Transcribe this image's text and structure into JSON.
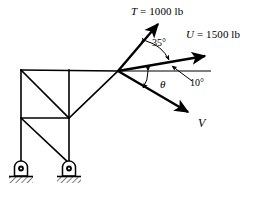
{
  "figure": {
    "type": "free-body / truss force diagram",
    "caption": "",
    "background_color": "#ffffff",
    "line_color": "#000000"
  },
  "forces": [
    {
      "id": "T",
      "symbol": "T",
      "equals": "=",
      "magnitude": "1000",
      "unit": "lb",
      "label": "T = 1000 lb",
      "direction": "up-right",
      "arrow": "single-head"
    },
    {
      "id": "U",
      "symbol": "U",
      "equals": "=",
      "magnitude": "1500",
      "unit": "lb",
      "label": "U = 1500 lb",
      "direction": "right-up",
      "arrow": "single-head"
    },
    {
      "id": "V",
      "symbol": "V",
      "equals": "",
      "magnitude": "",
      "unit": "",
      "label": "V",
      "direction": "down-right",
      "arrow": "single-head"
    }
  ],
  "angles": [
    {
      "id": "angle-35",
      "value": "35",
      "unit": "°",
      "label": "35°",
      "between": "T and U"
    },
    {
      "id": "angle-10",
      "value": "10",
      "unit": "°",
      "label": "10°",
      "between": "U and horizontal reference",
      "has_leader_line": true
    },
    {
      "id": "angle-theta",
      "value": "θ",
      "unit": "",
      "label": "θ",
      "between": "horizontal reference and V",
      "unknown": true
    }
  ],
  "structure": {
    "name": "bracket truss",
    "members": [
      "top chord",
      "left column",
      "center post",
      "mid chord",
      "upper diagonal",
      "lower diagonal",
      "gusset diagonal"
    ],
    "supports": [
      {
        "id": "support-left",
        "type": "pin-support",
        "ground": "hatched"
      },
      {
        "id": "support-right",
        "type": "pin-support",
        "ground": "hatched"
      }
    ],
    "load_joint": {
      "id": "joint-load",
      "description": "force application point"
    }
  }
}
